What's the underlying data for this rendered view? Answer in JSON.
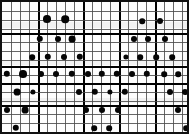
{
  "chart_data": {
    "type": "scatter",
    "title": "",
    "subtitle": "",
    "xlabel": "",
    "ylabel": "",
    "xlim": [
      0,
      20
    ],
    "ylim": [
      0,
      14
    ],
    "grid": true,
    "grid_minor_spacing_px": 9.3,
    "legend": null,
    "annotations": [],
    "tick_labels": {
      "x": [],
      "y": []
    },
    "marker": {
      "shape": "circle",
      "color": "#050505",
      "default_size_px": 4
    },
    "background_color": "#fdfdfd",
    "border_color": "#111111",
    "gridline_color_minor": "#4a4a4a",
    "gridline_color_major": "#000000",
    "point_count": 61,
    "points": [
      {
        "x": 45,
        "y": 17,
        "r": 4.0
      },
      {
        "x": 63,
        "y": 17,
        "r": 3.8
      },
      {
        "x": 140,
        "y": 19,
        "r": 2.8
      },
      {
        "x": 158,
        "y": 19,
        "r": 3.0
      },
      {
        "x": 38,
        "y": 37,
        "r": 3.2
      },
      {
        "x": 56,
        "y": 37,
        "r": 3.0
      },
      {
        "x": 70,
        "y": 37,
        "r": 3.4
      },
      {
        "x": 132,
        "y": 37,
        "r": 3.0
      },
      {
        "x": 146,
        "y": 37,
        "r": 3.0
      },
      {
        "x": 163,
        "y": 37,
        "r": 3.0
      },
      {
        "x": 30,
        "y": 55,
        "r": 2.8
      },
      {
        "x": 46,
        "y": 55,
        "r": 3.2
      },
      {
        "x": 62,
        "y": 55,
        "r": 3.0
      },
      {
        "x": 78,
        "y": 55,
        "r": 3.2
      },
      {
        "x": 124,
        "y": 55,
        "r": 2.6
      },
      {
        "x": 138,
        "y": 55,
        "r": 2.8
      },
      {
        "x": 154,
        "y": 55,
        "r": 2.8
      },
      {
        "x": 170,
        "y": 55,
        "r": 2.8
      },
      {
        "x": 5,
        "y": 72,
        "r": 3.2
      },
      {
        "x": 21,
        "y": 72,
        "r": 4.0
      },
      {
        "x": 39,
        "y": 72,
        "r": 3.0
      },
      {
        "x": 54,
        "y": 72,
        "r": 3.0
      },
      {
        "x": 70,
        "y": 72,
        "r": 3.2
      },
      {
        "x": 86,
        "y": 72,
        "r": 3.0
      },
      {
        "x": 100,
        "y": 72,
        "r": 3.2
      },
      {
        "x": 115,
        "y": 72,
        "r": 3.2
      },
      {
        "x": 130,
        "y": 72,
        "r": 3.0
      },
      {
        "x": 145,
        "y": 72,
        "r": 3.2
      },
      {
        "x": 162,
        "y": 72,
        "r": 2.8
      },
      {
        "x": 176,
        "y": 72,
        "r": 2.8
      },
      {
        "x": 15,
        "y": 90,
        "r": 3.4
      },
      {
        "x": 31,
        "y": 90,
        "r": 2.6
      },
      {
        "x": 77,
        "y": 90,
        "r": 3.0
      },
      {
        "x": 93,
        "y": 90,
        "r": 3.2
      },
      {
        "x": 108,
        "y": 90,
        "r": 2.6
      },
      {
        "x": 123,
        "y": 90,
        "r": 3.2
      },
      {
        "x": 168,
        "y": 90,
        "r": 3.0
      },
      {
        "x": 183,
        "y": 90,
        "r": 3.0
      },
      {
        "x": 5,
        "y": 108,
        "r": 3.0
      },
      {
        "x": 23,
        "y": 108,
        "r": 3.4
      },
      {
        "x": 84,
        "y": 108,
        "r": 3.0
      },
      {
        "x": 100,
        "y": 108,
        "r": 3.0
      },
      {
        "x": 116,
        "y": 108,
        "r": 3.0
      },
      {
        "x": 176,
        "y": 108,
        "r": 3.0
      },
      {
        "x": 14,
        "y": 126,
        "r": 3.2
      },
      {
        "x": 92,
        "y": 126,
        "r": 2.8
      },
      {
        "x": 107,
        "y": 126,
        "r": 2.8
      },
      {
        "x": 184,
        "y": 126,
        "r": 2.8
      }
    ],
    "vertical_gridlines": [
      {
        "x": 9,
        "weight": "minor"
      },
      {
        "x": 18,
        "weight": "minor"
      },
      {
        "x": 27,
        "weight": "minor"
      },
      {
        "x": 36,
        "weight": "major"
      },
      {
        "x": 45,
        "weight": "minor"
      },
      {
        "x": 54,
        "weight": "minor"
      },
      {
        "x": 63,
        "weight": "minor"
      },
      {
        "x": 72,
        "weight": "minor"
      },
      {
        "x": 81,
        "weight": "major"
      },
      {
        "x": 90,
        "weight": "minor"
      },
      {
        "x": 99,
        "weight": "minor"
      },
      {
        "x": 108,
        "weight": "minor"
      },
      {
        "x": 117,
        "weight": "major"
      },
      {
        "x": 126,
        "weight": "minor"
      },
      {
        "x": 135,
        "weight": "minor"
      },
      {
        "x": 144,
        "weight": "minor"
      },
      {
        "x": 153,
        "weight": "major"
      },
      {
        "x": 162,
        "weight": "minor"
      },
      {
        "x": 171,
        "weight": "minor"
      },
      {
        "x": 180,
        "weight": "minor"
      }
    ],
    "horizontal_gridlines": [
      {
        "y": 9,
        "weight": "minor"
      },
      {
        "y": 18,
        "weight": "minor"
      },
      {
        "y": 27,
        "weight": "minor"
      },
      {
        "y": 31,
        "weight": "major"
      },
      {
        "y": 40,
        "weight": "minor"
      },
      {
        "y": 49,
        "weight": "minor"
      },
      {
        "y": 58,
        "weight": "minor"
      },
      {
        "y": 64,
        "weight": "major"
      },
      {
        "y": 73,
        "weight": "minor"
      },
      {
        "y": 81,
        "weight": "major"
      },
      {
        "y": 90,
        "weight": "minor"
      },
      {
        "y": 99,
        "weight": "minor"
      },
      {
        "y": 103,
        "weight": "major"
      },
      {
        "y": 112,
        "weight": "minor"
      },
      {
        "y": 121,
        "weight": "minor"
      },
      {
        "y": 130,
        "weight": "minor"
      }
    ],
    "scan_bands": [
      {
        "y": 20,
        "h": 6
      },
      {
        "y": 58,
        "h": 5
      },
      {
        "y": 96,
        "h": 5
      }
    ]
  }
}
